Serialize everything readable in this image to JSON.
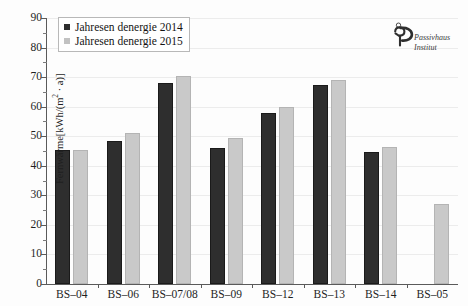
{
  "figure": {
    "title": "",
    "logo": {
      "name": "passivhaus-institut-logo",
      "line1": "Passivhaus",
      "line2": "Institut"
    }
  },
  "chart_data": {
    "type": "bar",
    "title": "",
    "xlabel": "",
    "ylabel": "Fernwärme[kWh/(m² · a)]",
    "ylabel_main": "Fernwärme[kWh/(m",
    "ylabel_sup": "2",
    "ylabel_tail": " · a)]",
    "ylim": [
      0,
      90
    ],
    "ytick_step": 10,
    "yticks": [
      0,
      10,
      20,
      30,
      40,
      50,
      60,
      70,
      80,
      90
    ],
    "ytick_labels": [
      "0",
      "10",
      "20",
      "30",
      "40",
      "50",
      "60",
      "70",
      "80",
      "90"
    ],
    "grid": true,
    "legend_position": "upper-left",
    "categories": [
      "BS–04",
      "BS–06",
      "BS–07/08",
      "BS–09",
      "BS–12",
      "BS–13",
      "BS–14",
      "BS–05"
    ],
    "series": [
      {
        "name": "Jahresen denergie 2014",
        "color": "#2e2e2e",
        "values": [
          45.5,
          48.5,
          68.0,
          46.0,
          58.0,
          67.5,
          44.5,
          null
        ]
      },
      {
        "name": "Jahresen denergie 2015",
        "color": "#c9c9c9",
        "values": [
          45.5,
          51.0,
          70.5,
          49.5,
          60.0,
          69.0,
          46.5,
          27.0
        ]
      }
    ]
  }
}
